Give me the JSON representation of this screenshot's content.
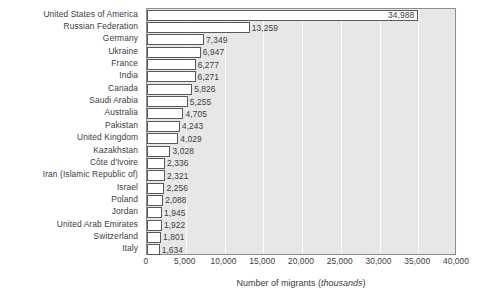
{
  "chart_data": {
    "type": "bar",
    "orientation": "horizontal",
    "title": "",
    "xlabel": "Number of migrants (thousands)",
    "xlabel_plain": "Number of migrants (",
    "xlabel_unit": "thousands",
    "xlabel_close": ")",
    "ylabel": "",
    "xlim": [
      0,
      40000
    ],
    "xticks": [
      0,
      5000,
      10000,
      15000,
      20000,
      25000,
      30000,
      35000,
      40000
    ],
    "xtick_labels": [
      "0",
      "5,000",
      "10,000",
      "15,000",
      "20,000",
      "25,000",
      "30,000",
      "35,000",
      "40,000"
    ],
    "grid": true,
    "grid_axis": "x",
    "legend": "none",
    "categories": [
      "United States of America",
      "Russian Federation",
      "Germany",
      "Ukraine",
      "France",
      "India",
      "Canada",
      "Saudi Arabia",
      "Australia",
      "Pakistan",
      "United Kingdom",
      "Kazakhstan",
      "Côte d'Ivoire",
      "Iran (Islamic Republic of)",
      "Israel",
      "Poland",
      "Jordan",
      "United Arab Emirates",
      "Switzerland",
      "Italy"
    ],
    "values": [
      34988,
      13259,
      7349,
      6947,
      6277,
      6271,
      5826,
      5255,
      4705,
      4243,
      4029,
      3028,
      2336,
      2321,
      2256,
      2088,
      1945,
      1922,
      1801,
      1634
    ],
    "value_labels": [
      "34,988",
      "13,259",
      "7,349",
      "6,947",
      "6,277",
      "6,271",
      "5,826",
      "5,255",
      "4,705",
      "4,243",
      "4,029",
      "3,028",
      "2,336",
      "2,321",
      "2,256",
      "2,088",
      "1,945",
      "1,922",
      "1,801",
      "1,634"
    ],
    "label_placement": [
      "inside",
      "outside",
      "outside",
      "outside",
      "outside",
      "outside",
      "outside",
      "outside",
      "outside",
      "outside",
      "outside",
      "outside",
      "outside",
      "outside",
      "outside",
      "outside",
      "outside",
      "outside",
      "outside",
      "outside"
    ]
  },
  "colors": {
    "page_background": "#ffffff",
    "plot_background": "#e7e7e7",
    "gridline": "#fbfbfb",
    "bar_fill": "#ffffff",
    "bar_stroke": "#5a5a5a",
    "plot_border": "#8d8d8d",
    "text": "#3d3d3d"
  }
}
